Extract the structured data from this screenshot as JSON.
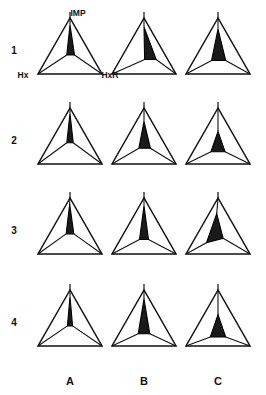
{
  "figure": {
    "title": "",
    "background_color": "#ffffff",
    "line_color": "#111111",
    "fill_color": "#1a1a1a"
  },
  "axis_labels": {
    "apex": "IMP",
    "bottom_left": "Hx",
    "bottom_right": "HxR"
  },
  "row_labels": [
    "1",
    "2",
    "3",
    "4"
  ],
  "column_labels": [
    "A",
    "B",
    "C"
  ],
  "chart_data": {
    "type": "scatter",
    "title": "",
    "subtitle": "",
    "xlabel": "",
    "ylabel": "",
    "legend_position": "none",
    "grid": false,
    "ternary_vertices": [
      "IMP",
      "Hx",
      "HxR"
    ],
    "rows": [
      "1",
      "2",
      "3",
      "4"
    ],
    "columns": [
      "A",
      "B",
      "C"
    ],
    "panels": [
      {
        "row": "1",
        "column": "A",
        "inner_shape": "narrow-tall-spike",
        "inner_centroid": {
          "IMP": 0.62,
          "Hx": 0.19,
          "HxR": 0.19
        },
        "inner_area_fraction": 0.05,
        "inner_polygon_ternary": [
          {
            "IMP": 0.88,
            "Hx": 0.06,
            "HxR": 0.06
          },
          {
            "IMP": 0.34,
            "Hx": 0.38,
            "HxR": 0.28
          },
          {
            "IMP": 0.34,
            "Hx": 0.26,
            "HxR": 0.4
          }
        ]
      },
      {
        "row": "1",
        "column": "B",
        "inner_shape": "narrow-tall-spike-offset",
        "inner_centroid": {
          "IMP": 0.55,
          "Hx": 0.18,
          "HxR": 0.27
        },
        "inner_area_fraction": 0.06,
        "inner_polygon_ternary": [
          {
            "IMP": 0.84,
            "Hx": 0.08,
            "HxR": 0.08
          },
          {
            "IMP": 0.26,
            "Hx": 0.36,
            "HxR": 0.38
          },
          {
            "IMP": 0.26,
            "Hx": 0.18,
            "HxR": 0.56
          }
        ]
      },
      {
        "row": "1",
        "column": "C",
        "inner_shape": "broad-triangle",
        "inner_centroid": {
          "IMP": 0.5,
          "Hx": 0.25,
          "HxR": 0.25
        },
        "inner_area_fraction": 0.11,
        "inner_polygon_ternary": [
          {
            "IMP": 0.8,
            "Hx": 0.1,
            "HxR": 0.1
          },
          {
            "IMP": 0.24,
            "Hx": 0.48,
            "HxR": 0.28
          },
          {
            "IMP": 0.24,
            "Hx": 0.26,
            "HxR": 0.5
          }
        ]
      },
      {
        "row": "2",
        "column": "A",
        "inner_shape": "narrow-tall-spike",
        "inner_centroid": {
          "IMP": 0.64,
          "Hx": 0.18,
          "HxR": 0.18
        },
        "inner_area_fraction": 0.04,
        "inner_polygon_ternary": [
          {
            "IMP": 0.9,
            "Hx": 0.05,
            "HxR": 0.05
          },
          {
            "IMP": 0.38,
            "Hx": 0.36,
            "HxR": 0.26
          },
          {
            "IMP": 0.38,
            "Hx": 0.26,
            "HxR": 0.36
          }
        ]
      },
      {
        "row": "2",
        "column": "B",
        "inner_shape": "small-triangle-mid",
        "inner_centroid": {
          "IMP": 0.47,
          "Hx": 0.26,
          "HxR": 0.27
        },
        "inner_area_fraction": 0.07,
        "inner_polygon_ternary": [
          {
            "IMP": 0.76,
            "Hx": 0.12,
            "HxR": 0.12
          },
          {
            "IMP": 0.28,
            "Hx": 0.44,
            "HxR": 0.28
          },
          {
            "IMP": 0.28,
            "Hx": 0.26,
            "HxR": 0.46
          }
        ]
      },
      {
        "row": "2",
        "column": "C",
        "inner_shape": "compact-triangle-center",
        "inner_centroid": {
          "IMP": 0.38,
          "Hx": 0.31,
          "HxR": 0.31
        },
        "inner_area_fraction": 0.08,
        "inner_polygon_ternary": [
          {
            "IMP": 0.58,
            "Hx": 0.21,
            "HxR": 0.21
          },
          {
            "IMP": 0.22,
            "Hx": 0.5,
            "HxR": 0.28
          },
          {
            "IMP": 0.22,
            "Hx": 0.28,
            "HxR": 0.5
          }
        ]
      },
      {
        "row": "3",
        "column": "A",
        "inner_shape": "narrow-tall-spike",
        "inner_centroid": {
          "IMP": 0.63,
          "Hx": 0.19,
          "HxR": 0.18
        },
        "inner_area_fraction": 0.04,
        "inner_polygon_ternary": [
          {
            "IMP": 0.89,
            "Hx": 0.06,
            "HxR": 0.05
          },
          {
            "IMP": 0.36,
            "Hx": 0.38,
            "HxR": 0.26
          },
          {
            "IMP": 0.36,
            "Hx": 0.26,
            "HxR": 0.38
          }
        ]
      },
      {
        "row": "3",
        "column": "B",
        "inner_shape": "narrow-spike-wide-base",
        "inner_centroid": {
          "IMP": 0.56,
          "Hx": 0.22,
          "HxR": 0.22
        },
        "inner_area_fraction": 0.06,
        "inner_polygon_ternary": [
          {
            "IMP": 0.86,
            "Hx": 0.07,
            "HxR": 0.07
          },
          {
            "IMP": 0.26,
            "Hx": 0.44,
            "HxR": 0.3
          },
          {
            "IMP": 0.26,
            "Hx": 0.3,
            "HxR": 0.44
          }
        ]
      },
      {
        "row": "3",
        "column": "C",
        "inner_shape": "slanted-wedge-left",
        "inner_centroid": {
          "IMP": 0.44,
          "Hx": 0.34,
          "HxR": 0.22
        },
        "inner_area_fraction": 0.08,
        "inner_polygon_ternary": [
          {
            "IMP": 0.72,
            "Hx": 0.16,
            "HxR": 0.12
          },
          {
            "IMP": 0.2,
            "Hx": 0.58,
            "HxR": 0.22
          },
          {
            "IMP": 0.28,
            "Hx": 0.28,
            "HxR": 0.44
          }
        ]
      },
      {
        "row": "4",
        "column": "A",
        "inner_shape": "narrow-tall-spike",
        "inner_centroid": {
          "IMP": 0.62,
          "Hx": 0.19,
          "HxR": 0.19
        },
        "inner_area_fraction": 0.04,
        "inner_polygon_ternary": [
          {
            "IMP": 0.88,
            "Hx": 0.06,
            "HxR": 0.06
          },
          {
            "IMP": 0.36,
            "Hx": 0.36,
            "HxR": 0.28
          },
          {
            "IMP": 0.36,
            "Hx": 0.28,
            "HxR": 0.36
          }
        ]
      },
      {
        "row": "4",
        "column": "B",
        "inner_shape": "tapered-spike-wide-base",
        "inner_centroid": {
          "IMP": 0.52,
          "Hx": 0.24,
          "HxR": 0.24
        },
        "inner_area_fraction": 0.07,
        "inner_polygon_ternary": [
          {
            "IMP": 0.84,
            "Hx": 0.08,
            "HxR": 0.08
          },
          {
            "IMP": 0.22,
            "Hx": 0.48,
            "HxR": 0.3
          },
          {
            "IMP": 0.22,
            "Hx": 0.3,
            "HxR": 0.48
          }
        ]
      },
      {
        "row": "4",
        "column": "C",
        "inner_shape": "compact-triangle-low-center",
        "inner_centroid": {
          "IMP": 0.34,
          "Hx": 0.33,
          "HxR": 0.33
        },
        "inner_area_fraction": 0.09,
        "inner_polygon_ternary": [
          {
            "IMP": 0.56,
            "Hx": 0.22,
            "HxR": 0.22
          },
          {
            "IMP": 0.16,
            "Hx": 0.54,
            "HxR": 0.3
          },
          {
            "IMP": 0.16,
            "Hx": 0.3,
            "HxR": 0.54
          }
        ]
      }
    ]
  }
}
